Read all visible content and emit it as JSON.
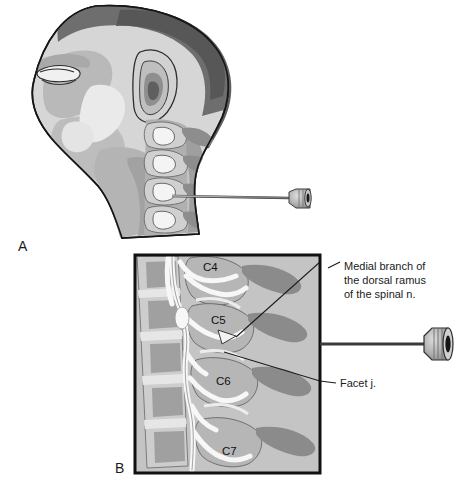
{
  "figure": {
    "panels": [
      {
        "letter": "A",
        "name": "lateral-head-neck-view",
        "description": "Lateral view of head and neck with cervical spine and needle inserted toward facet joint"
      },
      {
        "letter": "B",
        "name": "magnified-cervical-spine-view",
        "description": "Magnified boxed view of cervical vertebrae C4-C7 with medial branch nerves and needle"
      }
    ],
    "vertebra_labels": [
      {
        "id": "c4",
        "text": "C4"
      },
      {
        "id": "c5",
        "text": "C5"
      },
      {
        "id": "c6",
        "text": "C6"
      },
      {
        "id": "c7",
        "text": "C7"
      }
    ],
    "callouts": [
      {
        "id": "medial-branch",
        "lines": [
          "Medial branch of",
          "the dorsal ramus",
          "of the spinal n."
        ]
      },
      {
        "id": "facet-joint",
        "lines": [
          "Facet j."
        ]
      }
    ],
    "colors": {
      "outline": "#161616",
      "skin_light": "#d8d8d8",
      "skin_mid": "#bdbdbd",
      "skin_shadow": "#9d9d9d",
      "hair_dark": "#6f6f6f",
      "hair_darker": "#575757",
      "bone_light": "#cfcfcf",
      "bone_mid": "#a8a8a8",
      "bone_dark": "#878787",
      "nerve_white": "#f6f6f6",
      "panel_bg": "#c6c6c6",
      "needle_shaft": "#9a9a9a",
      "needle_hub": "#b2b2b2",
      "text": "#1b1b1b",
      "background": "#ffffff"
    }
  }
}
